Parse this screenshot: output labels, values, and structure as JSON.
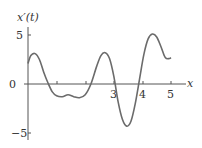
{
  "chart_data": {
    "type": "line",
    "title": "",
    "xlabel": "x",
    "ylabel": "x'(t)",
    "xlim": [
      0,
      5.4
    ],
    "ylim": [
      -5.5,
      5.8
    ],
    "x_ticks": [
      1,
      2,
      3,
      4,
      5
    ],
    "x_tick_labels": [
      "",
      "",
      "3",
      "4",
      "5"
    ],
    "y_ticks": [
      5,
      0,
      -5
    ],
    "y_tick_labels": [
      "5",
      "0",
      "−5"
    ],
    "grid": false,
    "legend": null,
    "series": [
      {
        "name": "x'(t)",
        "color": "#666666",
        "x": [
          0,
          0.1,
          0.25,
          0.4,
          0.55,
          0.7,
          0.85,
          1.0,
          1.2,
          1.4,
          1.6,
          1.8,
          2.0,
          2.2,
          2.4,
          2.55,
          2.7,
          2.85,
          3.0,
          3.15,
          3.3,
          3.45,
          3.6,
          3.75,
          3.9,
          4.05,
          4.2,
          4.35,
          4.5,
          4.65,
          4.8,
          4.95,
          5.0
        ],
        "y": [
          2.1,
          2.9,
          3.1,
          2.5,
          1.2,
          0.1,
          -0.8,
          -1.2,
          -1.3,
          -1.1,
          -1.3,
          -1.4,
          -1.1,
          0.0,
          1.8,
          2.9,
          3.2,
          2.6,
          0.8,
          -1.8,
          -3.6,
          -4.3,
          -3.8,
          -2.0,
          0.5,
          3.0,
          4.6,
          5.1,
          4.8,
          3.8,
          2.7,
          2.6,
          2.7
        ]
      }
    ]
  },
  "labels": {
    "y_axis_title": "x′(t)",
    "x_axis_title": "x",
    "y_tick_5": "5",
    "y_tick_0": "0",
    "y_tick_neg5": "−5",
    "x_tick_3": "3",
    "x_tick_4": "4",
    "x_tick_5": "5"
  },
  "colors": {
    "curve": "#6b6b6b",
    "axis": "#555555"
  }
}
